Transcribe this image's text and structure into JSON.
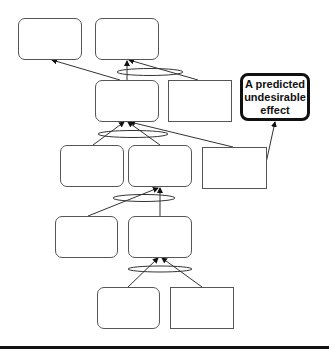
{
  "diagram": {
    "type": "current-reality-tree",
    "effect_label": "A predicted\nundesirable\neffect",
    "colors": {
      "line": "#333333",
      "box_border": "#555555",
      "effect_border": "#111111"
    },
    "nodes": [
      {
        "id": "n1",
        "shape": "rounded",
        "x": 18,
        "y": 18,
        "w": 64,
        "h": 42
      },
      {
        "id": "n2",
        "shape": "rounded",
        "x": 95,
        "y": 18,
        "w": 64,
        "h": 42
      },
      {
        "id": "n3",
        "shape": "rounded",
        "x": 95,
        "y": 80,
        "w": 64,
        "h": 42
      },
      {
        "id": "n4",
        "shape": "rect",
        "x": 168,
        "y": 80,
        "w": 64,
        "h": 42
      },
      {
        "id": "n5",
        "shape": "effect",
        "x": 240,
        "y": 73,
        "w": 70,
        "h": 48
      },
      {
        "id": "n6",
        "shape": "rounded",
        "x": 60,
        "y": 145,
        "w": 64,
        "h": 42
      },
      {
        "id": "n7",
        "shape": "rounded",
        "x": 128,
        "y": 145,
        "w": 64,
        "h": 42
      },
      {
        "id": "n8",
        "shape": "rect",
        "x": 202,
        "y": 147,
        "w": 65,
        "h": 42
      },
      {
        "id": "n9",
        "shape": "rounded",
        "x": 55,
        "y": 216,
        "w": 63,
        "h": 42
      },
      {
        "id": "n10",
        "shape": "rounded",
        "x": 128,
        "y": 216,
        "w": 64,
        "h": 42
      },
      {
        "id": "n11",
        "shape": "rounded",
        "x": 97,
        "y": 287,
        "w": 63,
        "h": 42
      },
      {
        "id": "n12",
        "shape": "rect",
        "x": 170,
        "y": 287,
        "w": 64,
        "h": 42
      }
    ]
  }
}
